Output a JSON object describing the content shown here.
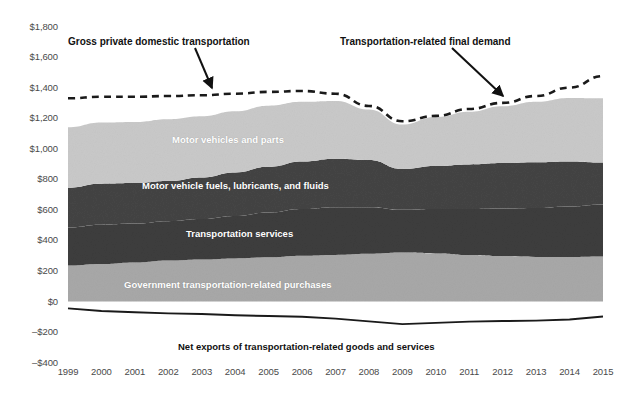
{
  "chart_data": {
    "type": "area",
    "title": "",
    "xlabel": "",
    "ylabel": "",
    "grid": false,
    "legend_position": "inline-band-labels",
    "x": [
      1999,
      2000,
      2001,
      2002,
      2003,
      2004,
      2005,
      2006,
      2007,
      2008,
      2009,
      2010,
      2011,
      2012,
      2013,
      2014,
      2015
    ],
    "categories": [
      "1999",
      "2000",
      "2001",
      "2002",
      "2003",
      "2004",
      "2005",
      "2006",
      "2007",
      "2008",
      "2009",
      "2010",
      "2011",
      "2012",
      "2013",
      "2014",
      "2015"
    ],
    "ylim": [
      -400,
      1800
    ],
    "yticks": [
      "$1,800",
      "$1,600",
      "$1,400",
      "$1,200",
      "$1,000",
      "$800",
      "$600",
      "$400",
      "$200",
      "$0",
      "–$200",
      "–$400"
    ],
    "ytick_values": [
      1800,
      1600,
      1400,
      1200,
      1000,
      800,
      600,
      400,
      200,
      0,
      -200,
      -400
    ],
    "units": "Billions of current dollars",
    "stacked_series": [
      {
        "name": "Government transportation-related purchases",
        "color": "#a8a8a8",
        "values": [
          235,
          245,
          255,
          268,
          275,
          282,
          290,
          300,
          305,
          312,
          320,
          315,
          305,
          298,
          292,
          292,
          295
        ]
      },
      {
        "name": "Transportation services",
        "color": "#3d3d3d",
        "values": [
          250,
          258,
          255,
          258,
          265,
          278,
          292,
          305,
          312,
          305,
          280,
          290,
          300,
          310,
          320,
          330,
          340
        ]
      },
      {
        "name": "Motor vehicle fuels, lubricants, and fluids",
        "color": "#444444",
        "values": [
          260,
          268,
          265,
          262,
          272,
          285,
          300,
          312,
          318,
          310,
          268,
          282,
          292,
          298,
          300,
          295,
          275
        ]
      },
      {
        "name": "Motor vehicles and parts",
        "color": "#c9c9c9",
        "values": [
          395,
          400,
          400,
          405,
          400,
          400,
          400,
          390,
          378,
          330,
          290,
          320,
          345,
          372,
          395,
          415,
          420
        ]
      }
    ],
    "total_line": {
      "name": "Transportation-related final demand",
      "style": "dashed",
      "color": "#1a1a1a",
      "values": [
        1330,
        1340,
        1340,
        1345,
        1350,
        1360,
        1372,
        1378,
        1360,
        1280,
        1180,
        1215,
        1260,
        1300,
        1345,
        1400,
        1475
      ]
    },
    "net_exports_line": {
      "name": "Net exports of transportation-related goods and services",
      "style": "solid",
      "color": "#1a1a1a",
      "values": [
        -45,
        -62,
        -70,
        -78,
        -82,
        -90,
        -95,
        -100,
        -112,
        -130,
        -148,
        -140,
        -132,
        -128,
        -125,
        -118,
        -98
      ]
    },
    "annotations": [
      {
        "name": "gross-private-domestic-transportation",
        "text": "Gross private domestic transportation",
        "label_x": 68,
        "label_y": 36,
        "arrow_from_x": 195,
        "arrow_from_y": 48,
        "arrow_to_x": 212,
        "arrow_to_y": 88
      },
      {
        "name": "transportation-related-final-demand",
        "text": "Transportation-related final demand",
        "label_x": 340,
        "label_y": 36,
        "arrow_from_x": 452,
        "arrow_from_y": 48,
        "arrow_to_x": 503,
        "arrow_to_y": 96
      }
    ],
    "band_labels": [
      {
        "text": "Motor vehicles and parts",
        "x": 172,
        "y": 134
      },
      {
        "text": "Motor vehicle fuels, lubricants, and fluids",
        "x": 142,
        "y": 180
      },
      {
        "text": "Transportation services",
        "x": 186,
        "y": 228
      },
      {
        "text": "Government transportation-related purchases",
        "x": 124,
        "y": 279
      }
    ],
    "net_label": {
      "text": "Net exports of transportation-related goods and services",
      "x": 178,
      "y": 341
    }
  },
  "colors": {
    "background": "#ffffff",
    "axis_text": "#4a4a4a",
    "line": "#1a1a1a",
    "band_motor_vehicles_parts": "#c9c9c9",
    "band_fuels": "#444444",
    "band_services": "#3d3d3d",
    "band_government": "#a8a8a8"
  }
}
